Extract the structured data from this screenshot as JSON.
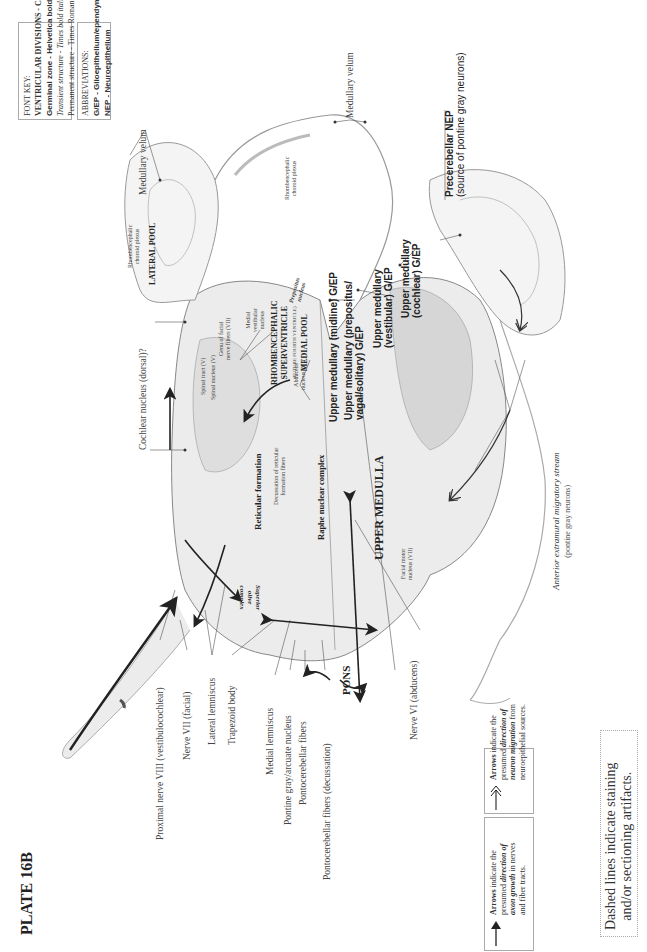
{
  "plate": {
    "title": "PLATE 16B"
  },
  "font_key": {
    "heading": "FONT KEY:",
    "lines": [
      "VENTRICULAR DIVISIONS - CAPITALS",
      "Germinal zone - Helvetica bold",
      "Transient structure - Times bold italic",
      "Permanent structure - Times Roman or Bold"
    ]
  },
  "abbreviations": {
    "heading": "ABBREVIATIONS:",
    "lines": [
      "G/EP - Glioepithelium/ependyma",
      "NEP - Neuroepithelium"
    ]
  },
  "regions": {
    "lateral_pool": "LATERAL POOL",
    "supraventricle_1": "RHOMBENCEPHALIC",
    "supraventricle_2": "SUPERVENTRICLE",
    "supraventricle_3": "(FUTURE FOURTH VENTRICLE)",
    "medial_pool": "MEDIAL POOL",
    "upper_medulla": "UPPER MEDULLA",
    "pons": "PONS"
  },
  "germinal_zones": {
    "midline": "Upper medullary (midline) G/EP",
    "prepositus_1": "Upper medullary (prepositus/",
    "prepositus_2": "vagal/solitary) G/EP",
    "vestibular_1": "Upper medullary",
    "vestibular_2": "(vestibular) G/EP",
    "cochlear_1": "Upper medullary",
    "cochlear_2": "(cochlear) G/EP",
    "precerebellar_1": "Precerebellar NEP",
    "precerebellar_2": "(source of pontine gray neurons)"
  },
  "labels": {
    "medullary_velum_left": "Medullary velum",
    "medullary_velum_top": "Medullary velum",
    "choroid_left_1": "Rhombencephalic",
    "choroid_left_2": "choroid plexus",
    "choroid_top_1": "Rhombencephalic",
    "choroid_top_2": "choroid plexus",
    "cochlear_nucleus": "Cochlear nucleus (dorsal)?",
    "spinal_tract": "Spinal tract (V)",
    "spinal_nucleus": "Spinal nucleus (V)",
    "genu_1": "Genu of facial",
    "genu_2": "nerve fibers (VII)",
    "medial_vestibular_1": "Medial",
    "medial_vestibular_2": "vestibular",
    "medial_vestibular_3": "nucleus",
    "prepositus_nucleus_1": "Prepositus",
    "prepositus_nucleus_2": "nucleus",
    "abducens_1": "Abducens",
    "abducens_2": "nucleus (VI)",
    "reticular_formation": "Reticular formation",
    "decussation_1": "Decussation of reticular",
    "decussation_2": "formation fibers",
    "raphe": "Raphe nuclear complex",
    "superior_olive_1": "Superior",
    "superior_olive_2": "olive",
    "superior_olive_3": "complex",
    "facial_motor_1": "Facial motor",
    "facial_motor_2": "nucleus (VII)",
    "anterior_stream": "Anterior extramural migratory stream",
    "anterior_stream_sub": "(pontine gray neurons)",
    "nerve_viii": "Proximal nerve VIII (vestibulocochlear)",
    "nerve_vii": "Nerve VII (facial)",
    "lateral_lemniscus": "Lateral lemniscus",
    "trapezoid": "Trapezoid body",
    "medial_lemniscus": "Medial lemniscus",
    "pontine_gray": "Pontine gray/arcuate nucleus",
    "pontocerebellar": "Pontocerebellar fibers",
    "pontocerebellar_dec": "Pontocerebellar fibers (decussation)",
    "nerve_vi": "Nerve VI (abducens)"
  },
  "legend": {
    "axon_growth": {
      "line1_bold": "Arrows",
      "line1_rest": " indicate the",
      "line2_a": "presumed ",
      "line2_b": "direction of",
      "line3_a": "axon growth",
      "line3_b": " in nerves",
      "line4": "and fiber tracts."
    },
    "neuron_migration": {
      "line1_bold": "Arrows",
      "line1_rest": " indicate the",
      "line2_a": "presumed ",
      "line2_b": "direction of",
      "line3_a": "neuron migration",
      "line3_b": " from",
      "line4": "neuroepithelial sources."
    },
    "dashed_note_1": "Dashed lines indicate staining",
    "dashed_note_2": "and/or sectioning artifacts."
  }
}
